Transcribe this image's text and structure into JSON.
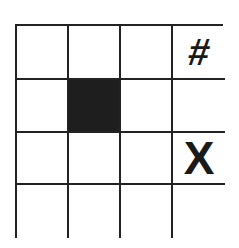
{
  "puzzle": {
    "rows": 4,
    "cols": 4,
    "colors": {
      "grid_line": "#222222",
      "filled_cell": "#1e1e1e",
      "empty_cell": "#ffffff",
      "symbol": "#1a1a1a"
    },
    "cells": [
      [
        {
          "state": "empty",
          "text": ""
        },
        {
          "state": "empty",
          "text": ""
        },
        {
          "state": "empty",
          "text": ""
        },
        {
          "state": "symbol",
          "text": "#"
        }
      ],
      [
        {
          "state": "empty",
          "text": ""
        },
        {
          "state": "filled",
          "text": ""
        },
        {
          "state": "empty",
          "text": ""
        },
        {
          "state": "empty",
          "text": ""
        }
      ],
      [
        {
          "state": "empty",
          "text": ""
        },
        {
          "state": "empty",
          "text": ""
        },
        {
          "state": "empty",
          "text": ""
        },
        {
          "state": "symbol",
          "text": "X"
        }
      ],
      [
        {
          "state": "empty",
          "text": ""
        },
        {
          "state": "empty",
          "text": ""
        },
        {
          "state": "empty",
          "text": ""
        },
        {
          "state": "empty",
          "text": ""
        }
      ]
    ]
  }
}
